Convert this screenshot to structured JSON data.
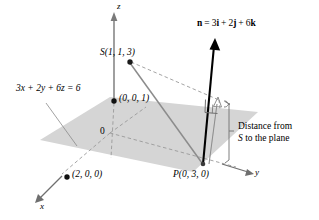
{
  "figure": {
    "kind": "3d-geometry-diagram",
    "colors": {
      "plane_fill": "#d3d3d3",
      "axis": "#808080",
      "dashed": "#9a9a9a",
      "normal_vector": "#000000",
      "gray_vector": "#8c8c8c",
      "text": "#000000",
      "background": "#ffffff"
    }
  },
  "axes": {
    "x_label": "x",
    "y_label": "y",
    "z_label": "z",
    "origin_label": "0"
  },
  "labels": {
    "plane_equation": "3x + 2y + 6z = 6",
    "normal_vector": "n = 3i + 2j + 6k",
    "normal_vector_parts": {
      "name": "n",
      "equals": "=",
      "i_coef": "3",
      "i": "i",
      "plus1": "+",
      "j_coef": "2",
      "j": "j",
      "plus2": "+",
      "k_coef": "6",
      "k": "k"
    },
    "point_S": "S(1, 1, 3)",
    "point_P": "P(0, 3, 0)",
    "intercept_z": "(0, 0, 1)",
    "intercept_x": "(2, 0, 0)",
    "distance_line1": "Distance from",
    "distance_line2_italic": "S",
    "distance_line2_rest": " to the plane"
  },
  "points": [
    {
      "name": "S",
      "label": "S(1, 1, 3)",
      "coords": [
        1,
        1,
        3
      ]
    },
    {
      "name": "P",
      "label": "P(0, 3, 0)",
      "coords": [
        0,
        3,
        0
      ]
    },
    {
      "name": "z-intercept",
      "label": "(0, 0, 1)",
      "coords": [
        0,
        0,
        1
      ]
    },
    {
      "name": "x-intercept",
      "label": "(2, 0, 0)",
      "coords": [
        2,
        0,
        0
      ]
    }
  ],
  "annotations": {
    "right_angle_marker": "right-angle",
    "brace": "distance-brace"
  }
}
